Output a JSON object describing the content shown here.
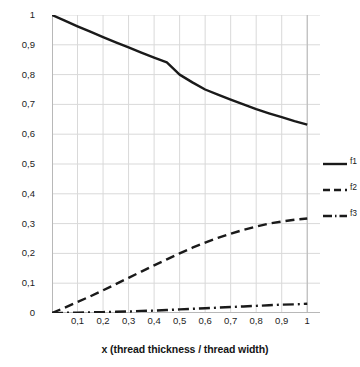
{
  "chart_data": {
    "type": "line",
    "title": "",
    "xlabel": "x (thread thickness / thread width)",
    "ylabel": "Proportion of areas in woven fabrics",
    "xlim": [
      0,
      1.05
    ],
    "ylim": [
      0,
      1
    ],
    "grid": true,
    "legend_position": "right",
    "x_tick_labels": [
      "0,1",
      "0,2",
      "0,3",
      "0,4",
      "0,5",
      "0,6",
      "0,7",
      "0,8",
      "0,9",
      "1"
    ],
    "x_tick_values": [
      0.1,
      0.2,
      0.3,
      0.4,
      0.5,
      0.6,
      0.7,
      0.8,
      0.9,
      1.0
    ],
    "y_tick_labels": [
      "0",
      "0,1",
      "0,2",
      "0,3",
      "0,4",
      "0,5",
      "0,6",
      "0,7",
      "0,8",
      "0,9",
      "1"
    ],
    "y_tick_values": [
      0,
      0.1,
      0.2,
      0.3,
      0.4,
      0.5,
      0.6,
      0.7,
      0.8,
      0.9,
      1.0
    ],
    "x": [
      0.0,
      0.05,
      0.1,
      0.15,
      0.2,
      0.25,
      0.3,
      0.35,
      0.4,
      0.45,
      0.5,
      0.55,
      0.6,
      0.65,
      0.7,
      0.75,
      0.8,
      0.85,
      0.9,
      0.95,
      1.0
    ],
    "series": [
      {
        "name": "f1",
        "style": "solid",
        "color": "#1a1a1a",
        "values": [
          1.0,
          0.981,
          0.962,
          0.944,
          0.926,
          0.908,
          0.891,
          0.874,
          0.857,
          0.841,
          0.8,
          0.774,
          0.75,
          0.733,
          0.716,
          0.7,
          0.684,
          0.67,
          0.657,
          0.644,
          0.632
        ]
      },
      {
        "name": "f2",
        "style": "dashed",
        "color": "#1a1a1a",
        "values": [
          0.0,
          0.018,
          0.037,
          0.056,
          0.076,
          0.097,
          0.118,
          0.139,
          0.16,
          0.18,
          0.2,
          0.219,
          0.236,
          0.252,
          0.266,
          0.279,
          0.29,
          0.3,
          0.307,
          0.313,
          0.317
        ]
      },
      {
        "name": "f3",
        "style": "dashdot",
        "color": "#1a1a1a",
        "values": [
          0.0,
          0.0005,
          0.001,
          0.002,
          0.003,
          0.004,
          0.005,
          0.007,
          0.008,
          0.01,
          0.012,
          0.014,
          0.016,
          0.018,
          0.02,
          0.022,
          0.024,
          0.026,
          0.028,
          0.029,
          0.031
        ]
      }
    ]
  },
  "legend": {
    "items": [
      {
        "label": "f1"
      },
      {
        "label": "f2"
      },
      {
        "label": "f3"
      }
    ]
  },
  "style": {
    "grid_color": "#d9d9d9",
    "axis_color": "#b8b8b8",
    "line_color": "#1a1a1a",
    "background": "#ffffff"
  }
}
